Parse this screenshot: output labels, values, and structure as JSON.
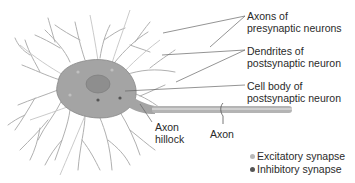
{
  "labels": {
    "axons_presynaptic": {
      "line1": "Axons of",
      "line2": "presynaptic neurons"
    },
    "dendrites_postsynaptic": {
      "line1": "Dendrites of",
      "line2": "postsynaptic neuron"
    },
    "cell_body_postsynaptic": {
      "line1": "Cell body of",
      "line2": "postsynaptic neuron"
    },
    "axon_hillock": {
      "line1": "Axon",
      "line2": "hillock"
    },
    "axon": "Axon"
  },
  "legend": [
    {
      "label": "Excitatory synapse",
      "color": "#b8b8b8"
    },
    {
      "label": "Inhibitory synapse",
      "color": "#555555"
    }
  ],
  "colors": {
    "neuron_body": "#9a9a9a",
    "dendrite": "#a8a8a8",
    "leader_line": "#666666"
  }
}
